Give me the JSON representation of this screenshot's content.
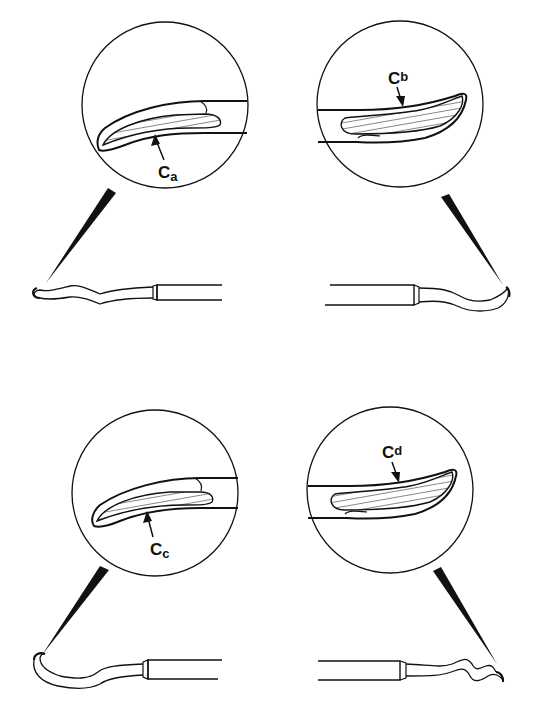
{
  "diagram": {
    "type": "technical-illustration",
    "panels": [
      {
        "id": "a",
        "position": "top-left",
        "label_main": "C",
        "label_sub": "a",
        "label": "Ca",
        "tip_direction": "left"
      },
      {
        "id": "b",
        "position": "top-right",
        "label_main": "C",
        "label_sub": "b",
        "label": "Cb",
        "tip_direction": "right"
      },
      {
        "id": "c",
        "position": "bottom-left",
        "label_main": "C",
        "label_sub": "c",
        "label": "Cc",
        "tip_direction": "left"
      },
      {
        "id": "d",
        "position": "bottom-right",
        "label_main": "C",
        "label_sub": "d",
        "label": "Cd",
        "tip_direction": "right"
      }
    ],
    "colors": {
      "ink": "#111111",
      "background": "#ffffff"
    }
  }
}
